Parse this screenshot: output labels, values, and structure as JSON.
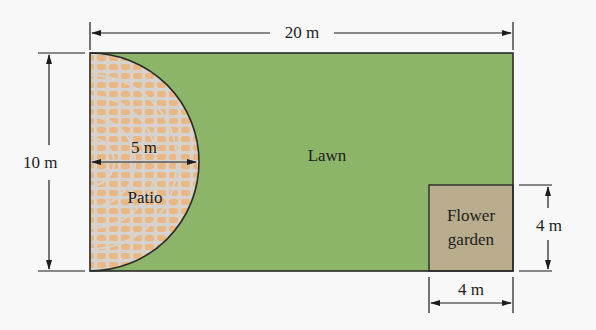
{
  "diagram": {
    "title": "",
    "colors": {
      "background": "#f7f8f7",
      "lawn": "#8db56a",
      "patio_base": "#d6d3cf",
      "patio_brick": "#e9b884",
      "flower_garden": "#b9ad8e",
      "outline": "#2a2a28"
    },
    "regions": {
      "lawn": {
        "label": "Lawn"
      },
      "patio": {
        "label": "Patio",
        "shape": "semicircle",
        "radius_label": "5 m"
      },
      "flower_garden": {
        "label_line1": "Flower",
        "label_line2": "garden",
        "shape": "square"
      }
    },
    "dimensions": {
      "width": "20 m",
      "height": "10 m",
      "patio_radius": "5 m",
      "garden_height": "4 m",
      "garden_width": "4 m"
    }
  }
}
